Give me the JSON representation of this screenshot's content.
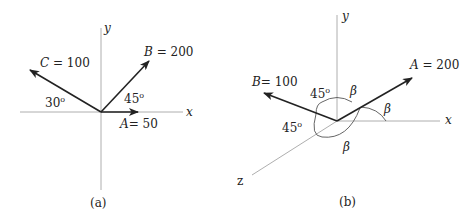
{
  "panel_a": {
    "caption": "(a)",
    "axis_x": "x",
    "axis_y": "y",
    "vectors": [
      {
        "name": "A",
        "label": "A= 50",
        "magnitude": 50,
        "angle_label": ""
      },
      {
        "name": "B",
        "label": "B = 200",
        "magnitude": 200,
        "angle_label": "45o"
      },
      {
        "name": "C",
        "label": "C = 100",
        "magnitude": 100,
        "angle_label": "30o"
      }
    ],
    "angle_b": "45",
    "angle_c": "30",
    "deg": "o"
  },
  "panel_b": {
    "caption": "(b)",
    "axis_x": "x",
    "axis_y": "y",
    "axis_z": "z",
    "vectors": [
      {
        "name": "A",
        "label": "A = 200",
        "magnitude": 200
      },
      {
        "name": "B",
        "label": "B= 100",
        "magnitude": 100
      }
    ],
    "angle_b_top": "45",
    "angle_b_bottom": "45",
    "deg": "o",
    "beta": "β"
  },
  "colors": {
    "axis": "#999999",
    "vector": "#222222",
    "text": "#222222"
  }
}
